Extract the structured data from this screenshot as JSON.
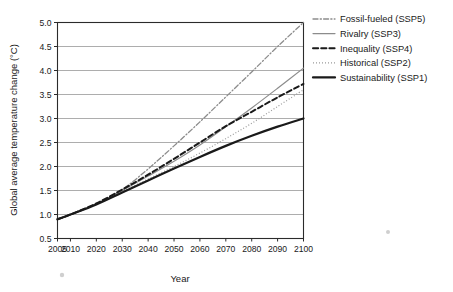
{
  "chart_data": {
    "type": "line",
    "title": "",
    "xlabel": "Year",
    "ylabel": "Global average temperature change (°C)",
    "xlim": [
      2005,
      2100
    ],
    "ylim": [
      0.5,
      5.0
    ],
    "grid": true,
    "grid_axis": "y",
    "legend_position": "right-outside",
    "x_ticks": [
      2005,
      2010,
      2020,
      2030,
      2040,
      2050,
      2060,
      2070,
      2080,
      2090,
      2100
    ],
    "x_tick_labels": [
      "2005",
      "2010",
      "2020",
      "2030",
      "2040",
      "2050",
      "2060",
      "2070",
      "2080",
      "2090",
      "2100"
    ],
    "y_ticks": [
      0.5,
      1.0,
      1.5,
      2.0,
      2.5,
      3.0,
      3.5,
      4.0,
      4.5,
      5.0
    ],
    "y_tick_labels": [
      "0.5",
      "1.0",
      "1.5",
      "2.0",
      "2.5",
      "3.0",
      "3.5",
      "4.0",
      "4.5",
      "5.0"
    ],
    "x": [
      2005,
      2010,
      2020,
      2030,
      2040,
      2050,
      2060,
      2070,
      2080,
      2090,
      2100
    ],
    "series": [
      {
        "name": "Fossil-fueled (SSP5)",
        "short_name": "SSP5",
        "style": "dash-dot",
        "color": "#8c8c8c",
        "width": 1.3,
        "values": [
          0.9,
          1.0,
          1.22,
          1.52,
          1.95,
          2.43,
          2.93,
          3.45,
          3.97,
          4.5,
          5.0
        ]
      },
      {
        "name": "Rivalry (SSP3)",
        "short_name": "SSP3",
        "style": "solid",
        "color": "#8c8c8c",
        "width": 1.2,
        "values": [
          0.9,
          1.0,
          1.22,
          1.5,
          1.8,
          2.11,
          2.45,
          2.83,
          3.22,
          3.63,
          4.05
        ]
      },
      {
        "name": "Inequality (SSP4)",
        "short_name": "SSP4",
        "style": "dashed",
        "color": "#1a1a1a",
        "width": 2.0,
        "values": [
          0.9,
          1.0,
          1.23,
          1.52,
          1.83,
          2.16,
          2.5,
          2.84,
          3.14,
          3.44,
          3.72
        ]
      },
      {
        "name": "Historical (SSP2)",
        "short_name": "SSP2",
        "style": "dotted",
        "color": "#9a9a9a",
        "width": 1.2,
        "values": [
          0.9,
          1.0,
          1.22,
          1.48,
          1.74,
          2.0,
          2.28,
          2.58,
          2.9,
          3.25,
          3.6
        ]
      },
      {
        "name": "Sustainability (SSP1)",
        "short_name": "SSP1",
        "style": "solid",
        "color": "#1a1a1a",
        "width": 2.2,
        "values": [
          0.9,
          1.0,
          1.21,
          1.46,
          1.71,
          1.96,
          2.2,
          2.43,
          2.64,
          2.83,
          3.0
        ]
      }
    ]
  },
  "legend": {
    "entries": [
      {
        "label": "Fossil-fueled (SSP5)"
      },
      {
        "label": "Rivalry (SSP3)"
      },
      {
        "label": "Inequality (SSP4)"
      },
      {
        "label": "Historical (SSP2)"
      },
      {
        "label": "Sustainability (SSP1)"
      }
    ]
  },
  "axes": {
    "x_title": "Year",
    "y_title": "Global average temperature change (°C)"
  }
}
